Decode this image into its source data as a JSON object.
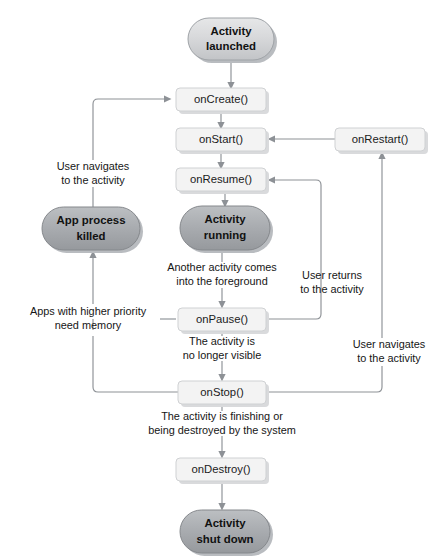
{
  "diagram": {
    "colors": {
      "background": "#ffffff",
      "method_box_fill": "#f3f3f3",
      "method_box_stroke": "#cfd1d3",
      "pill_fill_light": "#d5d6d8",
      "pill_fill_dark": "#a9acb0",
      "edge_stroke": "#8d9196",
      "text": "#1b1b1b"
    },
    "states": [
      {
        "id": "activity-launched",
        "label_line1": "Activity",
        "label_line2": "launched",
        "shape": "pill",
        "tone": "light",
        "x": 188,
        "y": 18,
        "w": 86,
        "h": 42
      },
      {
        "id": "activity-running",
        "label_line1": "Activity",
        "label_line2": "running",
        "shape": "pill",
        "tone": "dark",
        "x": 180,
        "y": 206,
        "w": 90,
        "h": 44
      },
      {
        "id": "app-process-killed",
        "label_line1": "App process",
        "label_line2": "killed",
        "shape": "pill",
        "tone": "dark",
        "x": 42,
        "y": 207,
        "w": 98,
        "h": 43
      },
      {
        "id": "activity-shut-down",
        "label_line1": "Activity",
        "label_line2": "shut down",
        "shape": "pill",
        "tone": "dark",
        "x": 180,
        "y": 510,
        "w": 90,
        "h": 43
      }
    ],
    "methods": [
      {
        "id": "on-create",
        "label": "onCreate()",
        "x": 176,
        "y": 88,
        "w": 90,
        "h": 23
      },
      {
        "id": "on-start",
        "label": "onStart()",
        "x": 176,
        "y": 128,
        "w": 90,
        "h": 23
      },
      {
        "id": "on-resume",
        "label": "onResume()",
        "x": 176,
        "y": 168,
        "w": 90,
        "h": 23
      },
      {
        "id": "on-restart",
        "label": "onRestart()",
        "x": 335,
        "y": 128,
        "w": 90,
        "h": 23
      },
      {
        "id": "on-pause",
        "label": "onPause()",
        "x": 178,
        "y": 308,
        "w": 88,
        "h": 23
      },
      {
        "id": "on-stop",
        "label": "onStop()",
        "x": 178,
        "y": 381,
        "w": 88,
        "h": 23
      },
      {
        "id": "on-destroy",
        "label": "onDestroy()",
        "x": 176,
        "y": 458,
        "w": 90,
        "h": 23
      }
    ],
    "edge_labels": [
      {
        "id": "user-navigates-left",
        "line1": "User navigates",
        "line2": "to the activity",
        "x": 93,
        "y": 172,
        "align": "middle"
      },
      {
        "id": "another-activity-foreground",
        "line1": "Another activity comes",
        "line2": "into the foreground",
        "x": 222,
        "y": 275,
        "align": "middle"
      },
      {
        "id": "user-returns",
        "line1": "User returns",
        "line2": "to the activity",
        "x": 322,
        "y": 283,
        "align": "middle"
      },
      {
        "id": "apps-higher-priority",
        "line1": "Apps with higher priority",
        "line2": "need memory",
        "x": 93,
        "y": 317,
        "align": "middle"
      },
      {
        "id": "no-longer-visible",
        "line1": "The activity is",
        "line2": "no longer visible",
        "x": 222,
        "y": 348,
        "align": "middle"
      },
      {
        "id": "user-navigates-right",
        "line1": "User navigates",
        "line2": "to the activity",
        "x": 382,
        "y": 352,
        "align": "middle"
      },
      {
        "id": "activity-finishing",
        "line1": "The activity is finishing or",
        "line2": "being destroyed by the system",
        "x": 222,
        "y": 423,
        "align": "middle"
      }
    ],
    "transitions": [
      {
        "id": "launched-to-create",
        "from": "activity-launched",
        "to": "on-create"
      },
      {
        "id": "create-to-start",
        "from": "on-create",
        "to": "on-start"
      },
      {
        "id": "start-to-resume",
        "from": "on-start",
        "to": "on-resume"
      },
      {
        "id": "resume-to-running",
        "from": "on-resume",
        "to": "activity-running"
      },
      {
        "id": "running-to-pause",
        "from": "activity-running",
        "to": "on-pause",
        "label": "another-activity-foreground"
      },
      {
        "id": "pause-to-resume",
        "from": "on-pause",
        "to": "on-resume",
        "label": "user-returns"
      },
      {
        "id": "pause-to-killed",
        "from": "on-pause",
        "to": "app-process-killed",
        "label": "apps-higher-priority"
      },
      {
        "id": "pause-to-stop",
        "from": "on-pause",
        "to": "on-stop",
        "label": "no-longer-visible"
      },
      {
        "id": "stop-to-killed",
        "from": "on-stop",
        "to": "app-process-killed"
      },
      {
        "id": "stop-to-restart",
        "from": "on-stop",
        "to": "on-restart",
        "label": "user-navigates-right"
      },
      {
        "id": "restart-to-start",
        "from": "on-restart",
        "to": "on-start"
      },
      {
        "id": "killed-to-create",
        "from": "app-process-killed",
        "to": "on-create",
        "label": "user-navigates-left"
      },
      {
        "id": "stop-to-destroy",
        "from": "on-stop",
        "to": "on-destroy",
        "label": "activity-finishing"
      },
      {
        "id": "destroy-to-shutdown",
        "from": "on-destroy",
        "to": "activity-shut-down"
      }
    ]
  }
}
